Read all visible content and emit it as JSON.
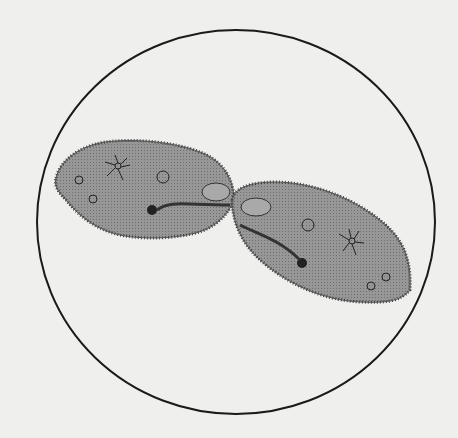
{
  "figure": {
    "field_of_view": {
      "shape": "circle",
      "stroke": "#1a1a1a"
    },
    "organisms": [
      {
        "name": "paramecium-left",
        "fill": "#8f8f8f"
      },
      {
        "name": "paramecium-right",
        "fill": "#8f8f8f"
      }
    ],
    "background_color": "#efefed"
  }
}
